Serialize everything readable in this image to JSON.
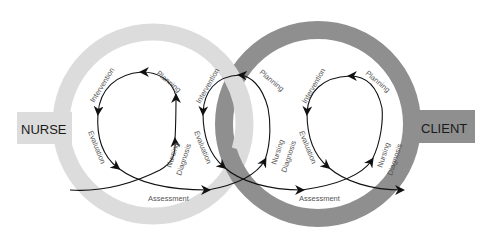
{
  "diagram": {
    "colors": {
      "nurse_ring": "#dcdcdc",
      "client_ring": "#8f8f8f",
      "arrows": "#111111",
      "step_text": "#555555",
      "box_text": "#1a1a1a"
    },
    "nurse": {
      "label": "NURSE"
    },
    "client": {
      "label": "CLIENT"
    },
    "cycles": [
      {
        "name": "nurse-cycle",
        "steps": [
          "Intervention",
          "Planning",
          "Evaluation",
          "Nursing",
          "Diagnosis",
          "Assessment"
        ]
      },
      {
        "name": "shared-cycle",
        "steps": [
          "Intervention",
          "Planning",
          "Evaluation",
          "Nursing",
          "Diagnosis"
        ]
      },
      {
        "name": "client-cycle",
        "steps": [
          "Intervention",
          "Planning",
          "Evaluation",
          "Nursing",
          "Diagnosis",
          "Assessment"
        ]
      }
    ]
  }
}
